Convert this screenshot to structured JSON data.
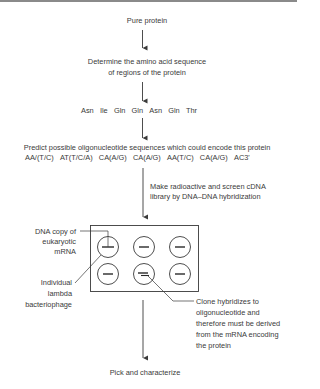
{
  "diagram": {
    "steps": {
      "pure_protein": "Pure protein",
      "determine_line1": "Determine the amino acid sequence",
      "determine_line2": "of regions of the protein",
      "amino_acids": [
        "Asn",
        "Ile",
        "Gln",
        "Gln",
        "Asn",
        "Gln",
        "Thr"
      ],
      "predict_line1": "Predict possible oligonucleotide sequences which could encode this protein",
      "oligo_codons": [
        "AA/(T/C)",
        "AT(T/C/A)",
        "CA(A/G)",
        "CA(A/G)",
        "AA(T/C)",
        "CA(A/G)",
        "AC3'"
      ],
      "screen_line1": "Make radioactive and screen cDNA",
      "screen_line2": "library by DNA–DNA hybridization",
      "pick": "Pick and characterize"
    },
    "labels": {
      "dna_copy": [
        "DNA copy of",
        "eukaryotic",
        "mRNA"
      ],
      "lambda": [
        "Individual",
        "lambda",
        "bacteriophage"
      ],
      "clone": [
        "Clone hybridizes to",
        "oligonucleotide and",
        "therefore must be derived",
        "from the mRNA encoding",
        "the protein"
      ]
    },
    "plate": {
      "rows": 2,
      "cols": 3,
      "positive_clone": "row 2, col 2"
    },
    "colors": {
      "line": "#3a3a3a",
      "text": "#3a3a3a",
      "top_rule": "#8a8a8a"
    }
  }
}
